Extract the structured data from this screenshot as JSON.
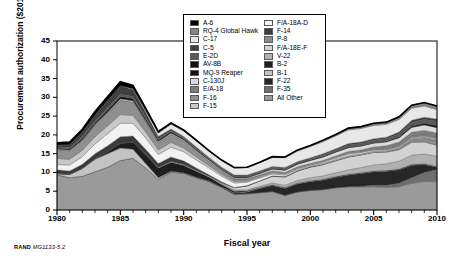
{
  "figure": {
    "credit_prefix": "RAND",
    "credit_id": "MG1133-5.2"
  },
  "chart_data": {
    "type": "area",
    "stacked": true,
    "title": "",
    "xlabel": "Fiscal year",
    "ylabel": "Procurement authorization ($2011B)",
    "xlim": [
      1980,
      2010
    ],
    "ylim": [
      0,
      45
    ],
    "yticks": [
      0,
      5,
      10,
      15,
      20,
      25,
      30,
      35,
      40,
      45
    ],
    "xticks": [
      1980,
      1985,
      1990,
      1995,
      2000,
      2005,
      2010
    ],
    "x_minor_tick_interval": 1,
    "grid": false,
    "legend_position": "top-center",
    "x": [
      1980,
      1981,
      1982,
      1983,
      1984,
      1985,
      1986,
      1987,
      1988,
      1989,
      1990,
      1991,
      1992,
      1993,
      1994,
      1995,
      1996,
      1997,
      1998,
      1999,
      2000,
      2001,
      2002,
      2003,
      2004,
      2005,
      2006,
      2007,
      2008,
      2009,
      2010
    ],
    "series": [
      {
        "name": "All Other",
        "color": "#9a9a9a",
        "values": [
          9.4,
          8.6,
          9.0,
          10.2,
          11.4,
          13.2,
          13.8,
          11.2,
          8.2,
          10.1,
          9.8,
          8.6,
          7.6,
          6.0,
          4.2,
          4.3,
          4.6,
          4.9,
          3.9,
          4.8,
          5.2,
          5.4,
          5.9,
          6.2,
          6.1,
          6.2,
          6.0,
          6.2,
          7.1,
          7.6,
          7.5
        ]
      },
      {
        "name": "F-35",
        "color": "#6e6e6e",
        "values": [
          0,
          0,
          0,
          0,
          0,
          0,
          0,
          0,
          0,
          0,
          0,
          0,
          0,
          0,
          0,
          0,
          0,
          0,
          0,
          0,
          0,
          0,
          0,
          0,
          0.2,
          0.4,
          0.6,
          0.9,
          1.5,
          2.4,
          3.3
        ]
      },
      {
        "name": "F-22",
        "color": "#262626",
        "values": [
          0,
          0,
          0,
          0,
          0,
          0,
          0,
          0,
          0,
          0,
          0,
          0,
          0,
          0,
          0.3,
          0.5,
          1.1,
          1.6,
          1.9,
          2.2,
          2.4,
          2.6,
          2.8,
          3.1,
          3.4,
          3.6,
          3.7,
          3.6,
          3.3,
          2.1,
          0.6
        ]
      },
      {
        "name": "B-1",
        "color": "#c3c3c3",
        "values": [
          0.3,
          0.9,
          2.1,
          3.3,
          3.6,
          3.3,
          2.4,
          1.2,
          0.4,
          0.2,
          0.1,
          0.1,
          0.1,
          0.1,
          0.1,
          0.1,
          0.1,
          0.1,
          0.1,
          0.1,
          0.1,
          0.1,
          0.1,
          0.1,
          0.1,
          0.1,
          0.1,
          0.1,
          0.1,
          0.1,
          0.1
        ]
      },
      {
        "name": "B-2",
        "color": "#1e1e1e",
        "values": [
          0,
          0,
          0,
          0.2,
          0.6,
          1.3,
          1.9,
          2.4,
          2.6,
          2.4,
          2.0,
          1.6,
          1.1,
          0.7,
          0.4,
          0.2,
          0.1,
          0.1,
          0.1,
          0.1,
          0.1,
          0.1,
          0.1,
          0.1,
          0.1,
          0.1,
          0.1,
          0.1,
          0.1,
          0.1,
          0.1
        ]
      },
      {
        "name": "V-22",
        "color": "#b0b0b0",
        "values": [
          0,
          0,
          0,
          0,
          0,
          0,
          0,
          0.1,
          0.2,
          0.3,
          0.3,
          0.3,
          0.3,
          0.3,
          0.3,
          0.3,
          0.4,
          0.5,
          0.6,
          0.7,
          0.8,
          0.9,
          1.0,
          1.2,
          1.4,
          1.6,
          1.8,
          2.1,
          2.5,
          2.6,
          2.7
        ]
      },
      {
        "name": "F/A-18E-F",
        "color": "#d2d2d2",
        "values": [
          0,
          0,
          0,
          0,
          0,
          0,
          0,
          0,
          0,
          0,
          0,
          0,
          0,
          0.2,
          0.6,
          1.0,
          1.4,
          1.8,
          2.2,
          2.5,
          2.8,
          3.0,
          3.2,
          3.4,
          3.4,
          3.3,
          3.1,
          3.0,
          3.4,
          3.2,
          2.9
        ]
      },
      {
        "name": "P-8",
        "color": "#8a8a8a",
        "values": [
          0,
          0,
          0,
          0,
          0,
          0,
          0,
          0,
          0,
          0,
          0,
          0,
          0,
          0,
          0,
          0,
          0,
          0,
          0,
          0,
          0,
          0,
          0,
          0,
          0,
          0.1,
          0.2,
          0.4,
          0.8,
          1.1,
          1.3
        ]
      },
      {
        "name": "F-14",
        "color": "#3a3a3a",
        "values": [
          1.0,
          0.9,
          1.1,
          1.3,
          1.5,
          1.7,
          1.6,
          1.3,
          1.0,
          1.1,
          0.9,
          0.6,
          0.3,
          0.2,
          0.1,
          0.1,
          0.1,
          0.1,
          0.1,
          0.1,
          0.1,
          0.1,
          0.1,
          0.1,
          0,
          0,
          0,
          0,
          0,
          0,
          0
        ]
      },
      {
        "name": "F/A-18A-D",
        "color": "#f2f2f2",
        "values": [
          1.4,
          1.6,
          2.0,
          2.6,
          3.2,
          3.6,
          3.4,
          3.0,
          2.4,
          2.6,
          2.4,
          2.1,
          1.8,
          1.5,
          1.2,
          0.9,
          0.7,
          0.5,
          0.4,
          0.3,
          0.2,
          0.2,
          0.2,
          0.2,
          0.2,
          0.2,
          0.2,
          0.2,
          0.2,
          0.2,
          0.2
        ]
      },
      {
        "name": "F-15",
        "color": "#c8c8c8",
        "values": [
          1.6,
          1.5,
          1.7,
          1.9,
          2.1,
          2.3,
          2.1,
          1.6,
          1.2,
          1.3,
          1.0,
          0.8,
          0.6,
          0.5,
          0.4,
          0.3,
          0.3,
          0.3,
          0.3,
          0.3,
          0.3,
          0.4,
          0.5,
          0.6,
          0.5,
          0.4,
          0.3,
          0.3,
          0.3,
          0.3,
          0.3
        ]
      },
      {
        "name": "F-16",
        "color": "#8f8f8f",
        "values": [
          2.4,
          2.3,
          2.6,
          3.0,
          3.4,
          3.8,
          3.5,
          2.8,
          2.0,
          2.2,
          1.9,
          1.5,
          1.2,
          0.9,
          0.7,
          0.6,
          0.5,
          0.5,
          0.4,
          0.4,
          0.4,
          0.4,
          0.4,
          0.4,
          0.3,
          0.3,
          0.3,
          0.3,
          0.3,
          0.3,
          0.3
        ]
      },
      {
        "name": "E/A-18",
        "color": "#7d7d7d",
        "values": [
          0,
          0,
          0,
          0,
          0,
          0,
          0,
          0,
          0,
          0,
          0,
          0,
          0,
          0,
          0,
          0,
          0,
          0,
          0,
          0,
          0,
          0,
          0.1,
          0.2,
          0.3,
          0.5,
          0.7,
          0.9,
          1.1,
          1.2,
          1.2
        ]
      },
      {
        "name": "C-130J",
        "color": "#dcdcdc",
        "values": [
          0.2,
          0.2,
          0.2,
          0.3,
          0.3,
          0.4,
          0.4,
          0.3,
          0.3,
          0.3,
          0.3,
          0.3,
          0.3,
          0.3,
          0.3,
          0.3,
          0.4,
          0.5,
          0.6,
          0.7,
          0.8,
          0.9,
          1.0,
          1.0,
          1.0,
          1.0,
          1.0,
          1.1,
          1.3,
          1.4,
          1.4
        ]
      },
      {
        "name": "MQ-9 Reaper",
        "color": "#141414",
        "values": [
          0,
          0,
          0,
          0,
          0,
          0,
          0,
          0,
          0,
          0,
          0,
          0,
          0,
          0,
          0,
          0,
          0,
          0,
          0,
          0,
          0,
          0,
          0,
          0,
          0.1,
          0.1,
          0.2,
          0.3,
          0.4,
          0.5,
          0.6
        ]
      },
      {
        "name": "AV-8B",
        "color": "#111111",
        "values": [
          0.2,
          0.3,
          0.4,
          0.5,
          0.6,
          0.7,
          0.6,
          0.5,
          0.4,
          0.4,
          0.3,
          0.3,
          0.2,
          0.2,
          0.2,
          0.2,
          0.2,
          0.2,
          0.2,
          0.2,
          0.2,
          0.2,
          0.2,
          0.2,
          0.1,
          0.1,
          0.1,
          0.1,
          0.1,
          0.1,
          0.1
        ]
      },
      {
        "name": "E-2D",
        "color": "#585858",
        "values": [
          0.3,
          0.3,
          0.4,
          0.4,
          0.5,
          0.5,
          0.5,
          0.4,
          0.3,
          0.3,
          0.3,
          0.3,
          0.3,
          0.3,
          0.3,
          0.3,
          0.3,
          0.3,
          0.3,
          0.3,
          0.3,
          0.4,
          0.4,
          0.5,
          0.5,
          0.6,
          0.6,
          0.7,
          0.8,
          0.9,
          1.0
        ]
      },
      {
        "name": "C-5",
        "color": "#3f3f3f",
        "values": [
          0.5,
          0.8,
          1.2,
          1.6,
          2.0,
          2.3,
          1.9,
          1.2,
          0.6,
          0.4,
          0.3,
          0.3,
          0.2,
          0.2,
          0.2,
          0.2,
          0.2,
          0.2,
          0.2,
          0.2,
          0.2,
          0.3,
          0.3,
          0.4,
          0.4,
          0.4,
          0.4,
          0.5,
          0.6,
          0.6,
          0.6
        ]
      },
      {
        "name": "C-17",
        "color": "#e8e8e8",
        "values": [
          0,
          0,
          0,
          0,
          0,
          0,
          0.2,
          0.5,
          0.9,
          1.3,
          1.5,
          1.6,
          1.7,
          1.8,
          1.9,
          2.0,
          2.2,
          2.4,
          2.6,
          2.8,
          3.0,
          3.2,
          3.4,
          3.6,
          3.6,
          3.5,
          3.4,
          3.3,
          3.2,
          3.0,
          2.5
        ]
      },
      {
        "name": "RQ-4 Global Hawk",
        "color": "#858585",
        "values": [
          0,
          0,
          0,
          0,
          0,
          0,
          0,
          0,
          0,
          0,
          0,
          0,
          0,
          0,
          0,
          0,
          0,
          0.1,
          0.1,
          0.2,
          0.2,
          0.3,
          0.3,
          0.4,
          0.4,
          0.5,
          0.5,
          0.6,
          0.7,
          0.8,
          0.9
        ]
      },
      {
        "name": "A-6",
        "color": "#000000",
        "values": [
          0.6,
          0.7,
          0.8,
          0.9,
          1.0,
          1.1,
          0.9,
          0.6,
          0.4,
          0.3,
          0.2,
          0.2,
          0.1,
          0.1,
          0.1,
          0.1,
          0.1,
          0.1,
          0.1,
          0.1,
          0.1,
          0.1,
          0.1,
          0.1,
          0.1,
          0.1,
          0.1,
          0.1,
          0.1,
          0.1,
          0.1
        ]
      }
    ],
    "legend_columns": [
      [
        {
          "label": "A-6",
          "color": "#000000"
        },
        {
          "label": "RQ-4 Global Hawk",
          "color": "#858585"
        },
        {
          "label": "C-17",
          "color": "#e8e8e8"
        },
        {
          "label": "C-5",
          "color": "#3f3f3f"
        },
        {
          "label": "E-2D",
          "color": "#585858"
        },
        {
          "label": "AV-8B",
          "color": "#111111"
        },
        {
          "label": "MQ-9 Reaper",
          "color": "#141414"
        },
        {
          "label": "C-130J",
          "color": "#dcdcdc"
        },
        {
          "label": "E/A-18",
          "color": "#7d7d7d"
        },
        {
          "label": "F-16",
          "color": "#8f8f8f"
        },
        {
          "label": "F-15",
          "color": "#c8c8c8"
        }
      ],
      [
        {
          "label": "F/A-18A-D",
          "color": "#f2f2f2"
        },
        {
          "label": "F-14",
          "color": "#3a3a3a"
        },
        {
          "label": "P-8",
          "color": "#8a8a8a"
        },
        {
          "label": "F/A-18E-F",
          "color": "#d2d2d2"
        },
        {
          "label": "V-22",
          "color": "#b0b0b0"
        },
        {
          "label": "B-2",
          "color": "#1e1e1e"
        },
        {
          "label": "B-1",
          "color": "#c3c3c3"
        },
        {
          "label": "F-22",
          "color": "#262626"
        },
        {
          "label": "F-35",
          "color": "#6e6e6e"
        },
        {
          "label": "All Other",
          "color": "#9a9a9a"
        }
      ]
    ]
  }
}
